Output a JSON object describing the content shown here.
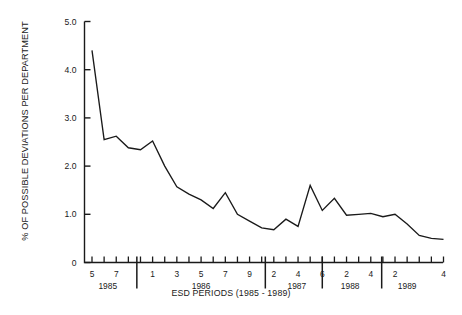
{
  "chart_data": {
    "type": "line",
    "title": "",
    "xlabel": "ESD PERIODS (1985 - 1989)",
    "ylabel": "% OF POSSIBLE DEVIATIONS PER DEPARTMENT",
    "ylim": [
      0,
      5.0
    ],
    "ytick_labels": [
      "0",
      "1.0",
      "2.0",
      "3.0",
      "4.0",
      "5.0"
    ],
    "ytick_values": [
      0,
      1.0,
      2.0,
      3.0,
      4.0,
      5.0
    ],
    "grid": false,
    "legend": "none",
    "x_tick_count": 30,
    "x_labeled_ticks": [
      {
        "index": 0,
        "label": "5"
      },
      {
        "index": 2,
        "label": "7"
      },
      {
        "index": 5,
        "label": "1"
      },
      {
        "index": 7,
        "label": "3"
      },
      {
        "index": 9,
        "label": "5"
      },
      {
        "index": 11,
        "label": "7"
      },
      {
        "index": 13,
        "label": "9"
      },
      {
        "index": 15,
        "label": "2"
      },
      {
        "index": 17,
        "label": "4"
      },
      {
        "index": 19,
        "label": "6"
      },
      {
        "index": 21,
        "label": "2"
      },
      {
        "index": 23,
        "label": "4"
      },
      {
        "index": 25,
        "label": "2"
      },
      {
        "index": 29,
        "label": "4"
      }
    ],
    "year_groups": [
      {
        "label": "1985",
        "center_index": 1.3
      },
      {
        "label": "1986",
        "center_index": 9.0
      },
      {
        "label": "1987",
        "center_index": 16.9
      },
      {
        "label": "1988",
        "center_index": 21.3
      },
      {
        "label": "1989",
        "center_index": 26.0
      }
    ],
    "year_separators": [
      3.7,
      14.3,
      19.0,
      23.9
    ],
    "series": [
      {
        "name": "% of possible deviations per department",
        "color": "#1a1a1a",
        "values": [
          4.4,
          2.55,
          2.62,
          2.38,
          2.34,
          2.52,
          2.0,
          1.57,
          1.42,
          1.3,
          1.12,
          1.45,
          1.0,
          0.86,
          0.72,
          0.68,
          0.9,
          0.75,
          1.6,
          1.08,
          1.33,
          0.98,
          1.0,
          1.02,
          0.95,
          1.0,
          0.8,
          0.56,
          0.5,
          0.48
        ]
      }
    ]
  },
  "axes": {
    "y_axis_name": "y-axis",
    "x_axis_name": "x-axis"
  }
}
